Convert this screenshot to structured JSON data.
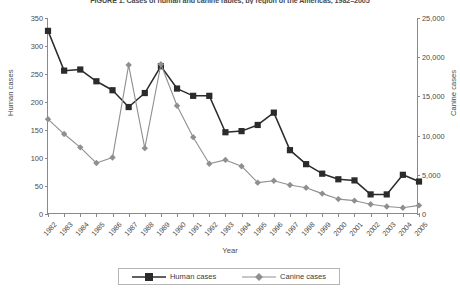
{
  "title": "FIGURE 1. Cases of human and canine rabies, by region of the Americas, 1982–2005",
  "axes": {
    "xlabel": "Year",
    "ylabel_left": "Human cases",
    "ylabel_right": "Canine cases",
    "left_ticks": [
      "0",
      "50",
      "100",
      "150",
      "200",
      "250",
      "300",
      "350"
    ],
    "right_ticks": [
      "0",
      "5,000",
      "10,000",
      "15,000",
      "20,000",
      "25,000"
    ],
    "left_range": [
      0,
      350
    ],
    "right_range": [
      0,
      25000
    ]
  },
  "legend": {
    "items": [
      {
        "label": "Human cases",
        "marker": "square",
        "color": "#2b2b2b"
      },
      {
        "label": "Canine cases",
        "marker": "diamond",
        "color": "#8f8f8f"
      }
    ]
  },
  "chart_data": {
    "type": "line",
    "title": "FIGURE 1. Cases of human and canine rabies, by region of the Americas, 1982–2005",
    "xlabel": "Year",
    "ylabel": "Human cases",
    "y2label": "Canine cases",
    "ylim": [
      0,
      350
    ],
    "y2lim": [
      0,
      25000
    ],
    "grid": false,
    "legend_position": "bottom",
    "categories": [
      "1982",
      "1983",
      "1984",
      "1985",
      "1986",
      "1987",
      "1988",
      "1989",
      "1990",
      "1991",
      "1992",
      "1993",
      "1994",
      "1995",
      "1996",
      "1997",
      "1998",
      "1999",
      "2000",
      "2001",
      "2002",
      "2003",
      "2004",
      "2005"
    ],
    "series": [
      {
        "name": "Human cases",
        "axis": "left",
        "color": "#2b2b2b",
        "marker": "square",
        "values": [
          327,
          256,
          258,
          237,
          221,
          191,
          216,
          264,
          224,
          211,
          211,
          146,
          148,
          159,
          181,
          114,
          89,
          72,
          62,
          60,
          35,
          35,
          70,
          58
        ]
      },
      {
        "name": "Canine cases",
        "axis": "right",
        "color": "#8f8f8f",
        "marker": "diamond",
        "values": [
          12100,
          10200,
          8500,
          6500,
          7200,
          19000,
          8400,
          19100,
          13800,
          9800,
          6400,
          6900,
          6100,
          4000,
          4250,
          3700,
          3350,
          2600,
          1900,
          1700,
          1250,
          950,
          800,
          1100
        ]
      }
    ]
  }
}
